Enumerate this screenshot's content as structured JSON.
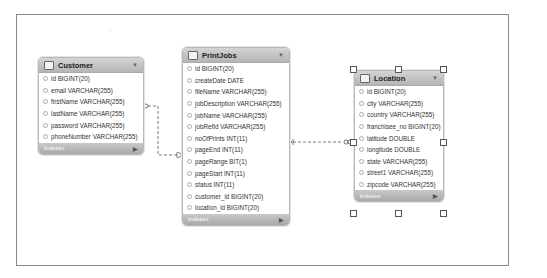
{
  "diagram": {
    "tables": [
      {
        "name": "Customer",
        "footer": "Indexes",
        "columns": [
          "id BIGINT(20)",
          "email VARCHAR(255)",
          "firstName VARCHAR(255)",
          "lastName VARCHAR(255)",
          "password VARCHAR(255)",
          "phoneNumber VARCHAR(255)"
        ]
      },
      {
        "name": "PrintJobs",
        "footer": "Indexes",
        "columns": [
          "id BIGINT(20)",
          "createDate DATE",
          "fileName VARCHAR(255)",
          "jobDescription VARCHAR(255)",
          "jobName VARCHAR(255)",
          "jobRefId VARCHAR(255)",
          "noOfPrints INT(11)",
          "pageEnd INT(11)",
          "pageRange BIT(1)",
          "pageStart INT(11)",
          "status INT(11)",
          "customer_id BIGINT(20)",
          "location_id BIGINT(20)"
        ]
      },
      {
        "name": "Location",
        "footer": "Indexes",
        "selected": true,
        "columns": [
          "id BIGINT(20)",
          "city VARCHAR(255)",
          "country VARCHAR(255)",
          "franchisee_no BIGINT(20)",
          "latitude DOUBLE",
          "longitude DOUBLE",
          "state VARCHAR(255)",
          "street1 VARCHAR(255)",
          "zipcode VARCHAR(255)"
        ]
      }
    ],
    "relationships": [
      {
        "from": "PrintJobs.customer_id",
        "to": "Customer",
        "style": "dashed",
        "cardinality": "many-to-one"
      },
      {
        "from": "PrintJobs.noOfPrints",
        "to": "Location.latitude",
        "style": "dashed",
        "cardinality": "many-to-one"
      }
    ],
    "colors": {
      "header": "#c4c4c4",
      "border": "#b8b8b8",
      "line": "#555555",
      "text": "#333333"
    }
  }
}
